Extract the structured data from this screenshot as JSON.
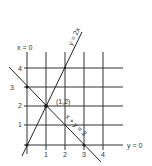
{
  "diagram": {
    "type": "graph-lines",
    "axis_labels": {
      "vertical_axis": "x = 0",
      "horizontal_axis": "y = 0"
    },
    "x_ticks": [
      "1",
      "2",
      "3",
      "4"
    ],
    "y_ticks": [
      "1",
      "2",
      "3",
      "4"
    ],
    "lines": [
      {
        "label": "y = 2x",
        "equation": "y = 2x"
      },
      {
        "label": "x + y = 3",
        "equation": "x + y = 3"
      }
    ],
    "intersection": {
      "label": "(1,2)",
      "x": 1,
      "y": 2
    },
    "colors": {
      "line": "#222222",
      "grid": "#333333",
      "text": "#333333"
    }
  }
}
